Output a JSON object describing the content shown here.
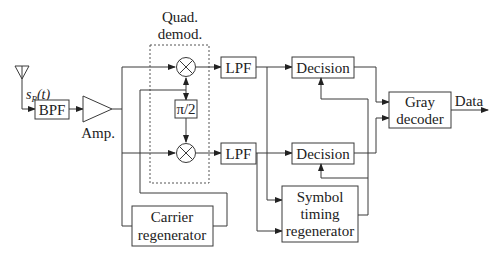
{
  "diagram": {
    "input_signal": {
      "symbol": "s",
      "subscript": "R",
      "arg": "(t)"
    },
    "blocks": {
      "bpf": "BPF",
      "amp": "Amp.",
      "quad_demod_line1": "Quad.",
      "quad_demod_line2": "demod.",
      "phase_shift": "π/2",
      "lpf_upper": "LPF",
      "lpf_lower": "LPF",
      "decision_upper": "Decision",
      "decision_lower": "Decision",
      "gray_line1": "Gray",
      "gray_line2": "decoder",
      "symbol_line1": "Symbol",
      "symbol_line2": "timing",
      "symbol_line3": "regenerator",
      "carrier_line1": "Carrier",
      "carrier_line2": "regenerator"
    },
    "output_label": "Data",
    "icons": {
      "antenna": "antenna-icon",
      "mixer": "mixer-multiply-icon",
      "amplifier": "amplifier-triangle-icon"
    },
    "colors": {
      "line": "#3a3a3a",
      "text": "#222222",
      "background": "#ffffff"
    }
  }
}
